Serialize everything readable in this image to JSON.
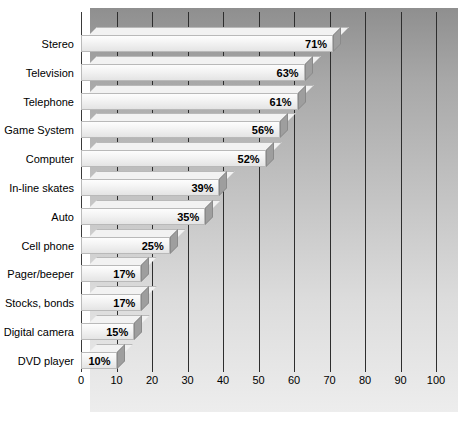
{
  "chart_data": {
    "type": "bar",
    "orientation": "horizontal",
    "title": "",
    "subtitle": "",
    "xlabel": "",
    "ylabel": "",
    "xlim": [
      0,
      100
    ],
    "xticks": [
      0,
      10,
      20,
      30,
      40,
      50,
      60,
      70,
      80,
      90,
      100
    ],
    "xtick_labels": [
      "0",
      "10",
      "20",
      "30",
      "40",
      "50",
      "60",
      "70",
      "80",
      "90",
      "100"
    ],
    "grid": true,
    "legend": null,
    "value_suffix": "%",
    "categories": [
      "Stereo",
      "Television",
      "Telephone",
      "Game System",
      "Computer",
      "In-line skates",
      "Auto",
      "Cell phone",
      "Pager/beeper",
      "Stocks, bonds",
      "Digital camera",
      "DVD player"
    ],
    "values": [
      71,
      63,
      61,
      56,
      52,
      39,
      35,
      25,
      17,
      17,
      15,
      10
    ],
    "value_labels": [
      "71%",
      "63%",
      "61%",
      "56%",
      "52%",
      "39%",
      "35%",
      "25%",
      "17%",
      "17%",
      "15%",
      "10%"
    ]
  },
  "style": {
    "panel_gradient_top": "#8f8f8f",
    "panel_gradient_bottom": "#ededed",
    "bar_face": "#f4f4f4",
    "bar_side": "#9e9e9e",
    "gridline_color": "#2e2e2e",
    "axis_color": "#3a3a3a",
    "text_color": "#000000"
  }
}
